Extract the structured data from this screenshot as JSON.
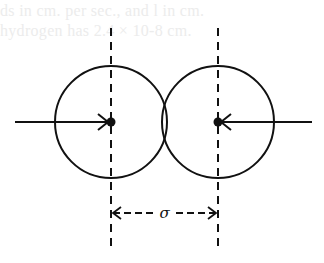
{
  "figure": {
    "bleed_through_text": [
      "ds in cm. per sec., and l in cm.",
      "hydrogen has 2.4 × 10-8 cm."
    ],
    "distance_label": "σ",
    "colors": {
      "ink": "#111111",
      "background": "#ffffff",
      "bleed": "#ececec"
    },
    "molecules": [
      {
        "name": "left-molecule",
        "cx": 111,
        "cy": 122,
        "r": 56,
        "velocity_direction": "right"
      },
      {
        "name": "right-molecule",
        "cx": 218,
        "cy": 122,
        "r": 56,
        "velocity_direction": "left"
      }
    ]
  }
}
